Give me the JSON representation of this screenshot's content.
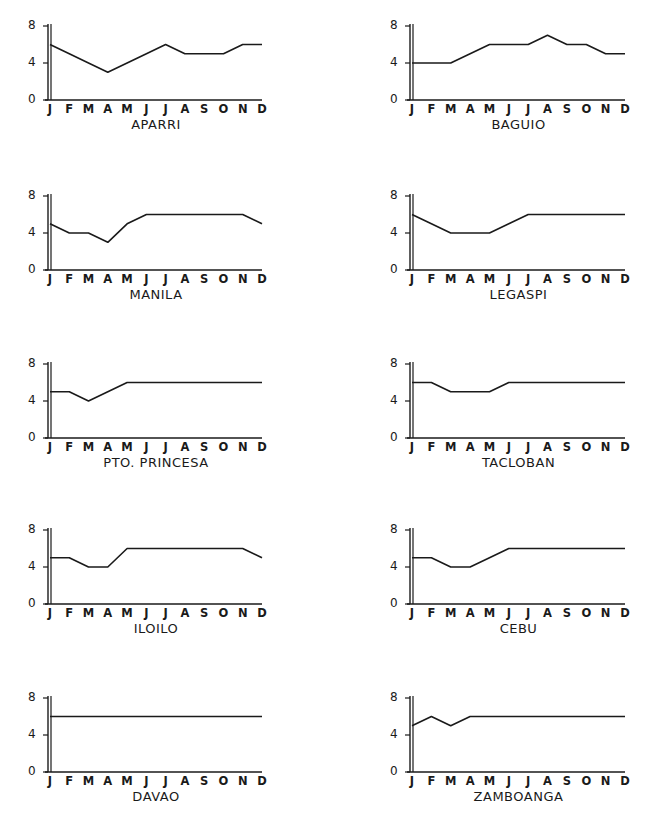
{
  "figure": {
    "y_ticks": [
      "0",
      "4",
      "8"
    ],
    "months": [
      "J",
      "F",
      "M",
      "A",
      "M",
      "J",
      "J",
      "A",
      "S",
      "O",
      "N",
      "D"
    ],
    "line_color": "#1a1a1a"
  },
  "chart_data": [
    {
      "type": "line",
      "title": "APARRI",
      "categories": [
        "J",
        "F",
        "M",
        "A",
        "M",
        "J",
        "J",
        "A",
        "S",
        "O",
        "N",
        "D"
      ],
      "values": [
        6,
        5,
        4,
        3,
        4,
        5,
        6,
        5,
        5,
        5,
        6,
        6
      ],
      "ylim": [
        0,
        8
      ],
      "yticks": [
        0,
        4,
        8
      ],
      "xlabel": "",
      "ylabel": "",
      "grid": false
    },
    {
      "type": "line",
      "title": "BAGUIO",
      "categories": [
        "J",
        "F",
        "M",
        "A",
        "M",
        "J",
        "J",
        "A",
        "S",
        "O",
        "N",
        "D"
      ],
      "values": [
        4,
        4,
        4,
        5,
        6,
        6,
        6,
        7,
        6,
        6,
        5,
        5
      ],
      "ylim": [
        0,
        8
      ],
      "yticks": [
        0,
        4,
        8
      ],
      "xlabel": "",
      "ylabel": "",
      "grid": false
    },
    {
      "type": "line",
      "title": "MANILA",
      "categories": [
        "J",
        "F",
        "M",
        "A",
        "M",
        "J",
        "J",
        "A",
        "S",
        "O",
        "N",
        "D"
      ],
      "values": [
        5,
        4,
        4,
        3,
        5,
        6,
        6,
        6,
        6,
        6,
        6,
        5
      ],
      "ylim": [
        0,
        8
      ],
      "yticks": [
        0,
        4,
        8
      ],
      "xlabel": "",
      "ylabel": "",
      "grid": false
    },
    {
      "type": "line",
      "title": "LEGASPI",
      "categories": [
        "J",
        "F",
        "M",
        "A",
        "M",
        "J",
        "J",
        "A",
        "S",
        "O",
        "N",
        "D"
      ],
      "values": [
        6,
        5,
        4,
        4,
        4,
        5,
        6,
        6,
        6,
        6,
        6,
        6
      ],
      "ylim": [
        0,
        8
      ],
      "yticks": [
        0,
        4,
        8
      ],
      "xlabel": "",
      "ylabel": "",
      "grid": false
    },
    {
      "type": "line",
      "title": "PTO. PRINCESA",
      "categories": [
        "J",
        "F",
        "M",
        "A",
        "M",
        "J",
        "J",
        "A",
        "S",
        "O",
        "N",
        "D"
      ],
      "values": [
        5,
        5,
        4,
        5,
        6,
        6,
        6,
        6,
        6,
        6,
        6,
        6
      ],
      "ylim": [
        0,
        8
      ],
      "yticks": [
        0,
        4,
        8
      ],
      "xlabel": "",
      "ylabel": "",
      "grid": false
    },
    {
      "type": "line",
      "title": "TACLOBAN",
      "categories": [
        "J",
        "F",
        "M",
        "A",
        "M",
        "J",
        "J",
        "A",
        "S",
        "O",
        "N",
        "D"
      ],
      "values": [
        6,
        6,
        5,
        5,
        5,
        6,
        6,
        6,
        6,
        6,
        6,
        6
      ],
      "ylim": [
        0,
        8
      ],
      "yticks": [
        0,
        4,
        8
      ],
      "xlabel": "",
      "ylabel": "",
      "grid": false
    },
    {
      "type": "line",
      "title": "ILOILO",
      "categories": [
        "J",
        "F",
        "M",
        "A",
        "M",
        "J",
        "J",
        "A",
        "S",
        "O",
        "N",
        "D"
      ],
      "values": [
        5,
        5,
        4,
        4,
        6,
        6,
        6,
        6,
        6,
        6,
        6,
        5
      ],
      "ylim": [
        0,
        8
      ],
      "yticks": [
        0,
        4,
        8
      ],
      "xlabel": "",
      "ylabel": "",
      "grid": false
    },
    {
      "type": "line",
      "title": "CEBU",
      "categories": [
        "J",
        "F",
        "M",
        "A",
        "M",
        "J",
        "J",
        "A",
        "S",
        "O",
        "N",
        "D"
      ],
      "values": [
        5,
        5,
        4,
        4,
        5,
        6,
        6,
        6,
        6,
        6,
        6,
        6
      ],
      "ylim": [
        0,
        8
      ],
      "yticks": [
        0,
        4,
        8
      ],
      "xlabel": "",
      "ylabel": "",
      "grid": false
    },
    {
      "type": "line",
      "title": "DAVAO",
      "categories": [
        "J",
        "F",
        "M",
        "A",
        "M",
        "J",
        "J",
        "A",
        "S",
        "O",
        "N",
        "D"
      ],
      "values": [
        6,
        6,
        6,
        6,
        6,
        6,
        6,
        6,
        6,
        6,
        6,
        6
      ],
      "ylim": [
        0,
        8
      ],
      "yticks": [
        0,
        4,
        8
      ],
      "xlabel": "",
      "ylabel": "",
      "grid": false
    },
    {
      "type": "line",
      "title": "ZAMBOANGA",
      "categories": [
        "J",
        "F",
        "M",
        "A",
        "M",
        "J",
        "J",
        "A",
        "S",
        "O",
        "N",
        "D"
      ],
      "values": [
        5,
        6,
        5,
        6,
        6,
        6,
        6,
        6,
        6,
        6,
        6,
        6
      ],
      "ylim": [
        0,
        8
      ],
      "yticks": [
        0,
        4,
        8
      ],
      "xlabel": "",
      "ylabel": "",
      "grid": false
    }
  ]
}
